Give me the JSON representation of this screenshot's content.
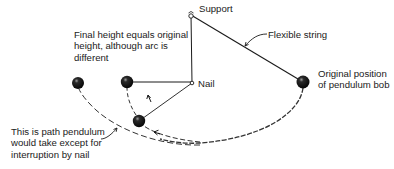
{
  "diagram": {
    "colors": {
      "ink": "#1a1a1a",
      "bob": "#111111",
      "background": "#ffffff"
    },
    "labels": {
      "support": "Support",
      "flexible_string": "Flexible string",
      "nail": "Nail",
      "original_position": {
        "line1": "Original position",
        "line2": "of pendulum bob"
      },
      "final_height": {
        "line1": "Final height equals original",
        "line2": "height, although arc is",
        "line3": "different"
      },
      "uninterrupted_path": {
        "line1": "This is path pendulum",
        "line2": "would take except for",
        "line3": "interruption by nail"
      }
    },
    "points": {
      "support": [
        191,
        15
      ],
      "nail": [
        192,
        83
      ],
      "bob_original": [
        303,
        82
      ],
      "bob_lowest": [
        139,
        121
      ],
      "bob_final": [
        127,
        82
      ],
      "bob_uninterrupted_end": [
        78,
        83
      ]
    }
  }
}
